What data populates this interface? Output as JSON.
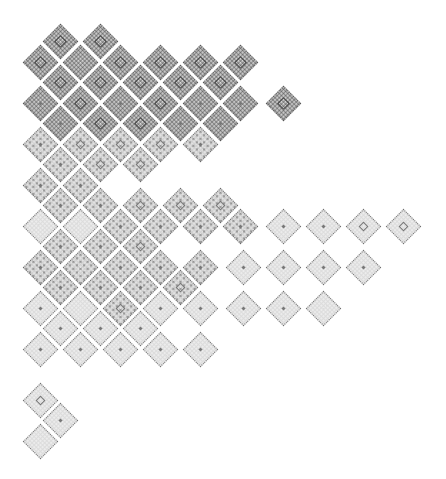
{
  "title": "",
  "colors": {
    "background": "#ffffff",
    "outline": "#6e6e6e",
    "fill": "#ececec",
    "dense_fill": "#d8d8d8"
  },
  "tile_size": 25,
  "rows": [
    {
      "y": 41,
      "tiles": [
        {
          "x": 60,
          "d": "dense",
          "c": "box"
        },
        {
          "x": 100,
          "d": "dense",
          "c": "box"
        }
      ]
    },
    {
      "y": 62,
      "tiles": [
        {
          "x": 40,
          "d": "dense",
          "c": "box"
        },
        {
          "x": 80,
          "d": "dense",
          "c": "none"
        },
        {
          "x": 120,
          "d": "dense",
          "c": "box"
        },
        {
          "x": 160,
          "d": "dense",
          "c": "box"
        },
        {
          "x": 200,
          "d": "dense",
          "c": "box"
        },
        {
          "x": 240,
          "d": "dense",
          "c": "box"
        }
      ]
    },
    {
      "y": 82,
      "tiles": [
        {
          "x": 60,
          "d": "dense",
          "c": "box"
        },
        {
          "x": 100,
          "d": "dense",
          "c": "box"
        },
        {
          "x": 140,
          "d": "dense",
          "c": "box"
        },
        {
          "x": 180,
          "d": "dense",
          "c": "box"
        },
        {
          "x": 220,
          "d": "dense",
          "c": "box"
        }
      ]
    },
    {
      "y": 103,
      "tiles": [
        {
          "x": 40,
          "d": "dense",
          "c": "dot"
        },
        {
          "x": 80,
          "d": "dense",
          "c": "box"
        },
        {
          "x": 120,
          "d": "dense",
          "c": "dot"
        },
        {
          "x": 160,
          "d": "dense",
          "c": "box"
        },
        {
          "x": 200,
          "d": "dense",
          "c": "dot"
        },
        {
          "x": 240,
          "d": "dense",
          "c": "dot"
        },
        {
          "x": 283,
          "d": "dense",
          "c": "box"
        }
      ]
    },
    {
      "y": 123,
      "tiles": [
        {
          "x": 60,
          "d": "dense",
          "c": "dot"
        },
        {
          "x": 100,
          "d": "dense",
          "c": "box"
        },
        {
          "x": 140,
          "d": "dense",
          "c": "box"
        },
        {
          "x": 180,
          "d": "dense",
          "c": "dot"
        },
        {
          "x": 220,
          "d": "dense",
          "c": "dot"
        }
      ]
    },
    {
      "y": 144,
      "tiles": [
        {
          "x": 40,
          "d": "medium",
          "c": "dot"
        },
        {
          "x": 80,
          "d": "medium",
          "c": "box"
        },
        {
          "x": 120,
          "d": "medium",
          "c": "box"
        },
        {
          "x": 160,
          "d": "medium",
          "c": "box"
        },
        {
          "x": 200,
          "d": "medium",
          "c": "dot"
        }
      ]
    },
    {
      "y": 164,
      "tiles": [
        {
          "x": 60,
          "d": "medium",
          "c": "dot"
        },
        {
          "x": 100,
          "d": "medium",
          "c": "box"
        },
        {
          "x": 140,
          "d": "medium",
          "c": "box"
        }
      ]
    },
    {
      "y": 185,
      "tiles": [
        {
          "x": 40,
          "d": "medium",
          "c": "dot"
        },
        {
          "x": 80,
          "d": "medium",
          "c": "dot"
        }
      ]
    },
    {
      "y": 205,
      "tiles": [
        {
          "x": 60,
          "d": "medium",
          "c": "dot"
        },
        {
          "x": 100,
          "d": "medium",
          "c": "dot"
        },
        {
          "x": 140,
          "d": "medium",
          "c": "box"
        },
        {
          "x": 180,
          "d": "medium",
          "c": "box"
        },
        {
          "x": 220,
          "d": "medium",
          "c": "box"
        }
      ]
    },
    {
      "y": 226,
      "tiles": [
        {
          "x": 40,
          "d": "light",
          "c": "none"
        },
        {
          "x": 80,
          "d": "light",
          "c": "none"
        },
        {
          "x": 120,
          "d": "medium",
          "c": "dot"
        },
        {
          "x": 160,
          "d": "medium",
          "c": "dot"
        },
        {
          "x": 200,
          "d": "medium",
          "c": "dot"
        },
        {
          "x": 240,
          "d": "medium",
          "c": "dot"
        },
        {
          "x": 283,
          "d": "light",
          "c": "dot"
        },
        {
          "x": 323,
          "d": "light",
          "c": "dot"
        },
        {
          "x": 363,
          "d": "light",
          "c": "box"
        },
        {
          "x": 403,
          "d": "light",
          "c": "box"
        }
      ]
    },
    {
      "y": 246,
      "tiles": [
        {
          "x": 60,
          "d": "medium",
          "c": "dot"
        },
        {
          "x": 100,
          "d": "medium",
          "c": "dot"
        },
        {
          "x": 140,
          "d": "medium",
          "c": "box"
        }
      ]
    },
    {
      "y": 267,
      "tiles": [
        {
          "x": 40,
          "d": "medium",
          "c": "dot"
        },
        {
          "x": 80,
          "d": "medium",
          "c": "none"
        },
        {
          "x": 120,
          "d": "medium",
          "c": "dot"
        },
        {
          "x": 160,
          "d": "medium",
          "c": "dot"
        },
        {
          "x": 200,
          "d": "medium",
          "c": "dot"
        },
        {
          "x": 243,
          "d": "light",
          "c": "dot"
        },
        {
          "x": 283,
          "d": "light",
          "c": "dot"
        },
        {
          "x": 323,
          "d": "light",
          "c": "dot"
        },
        {
          "x": 363,
          "d": "light",
          "c": "dot"
        }
      ]
    },
    {
      "y": 287,
      "tiles": [
        {
          "x": 60,
          "d": "medium",
          "c": "dot"
        },
        {
          "x": 100,
          "d": "medium",
          "c": "dot"
        },
        {
          "x": 140,
          "d": "medium",
          "c": "dot"
        },
        {
          "x": 180,
          "d": "medium",
          "c": "box"
        }
      ]
    },
    {
      "y": 308,
      "tiles": [
        {
          "x": 40,
          "d": "light",
          "c": "dot"
        },
        {
          "x": 80,
          "d": "light",
          "c": "none"
        },
        {
          "x": 120,
          "d": "medium",
          "c": "box"
        },
        {
          "x": 160,
          "d": "light",
          "c": "dot"
        },
        {
          "x": 200,
          "d": "light",
          "c": "dot"
        },
        {
          "x": 243,
          "d": "light",
          "c": "dot"
        },
        {
          "x": 283,
          "d": "light",
          "c": "dot"
        },
        {
          "x": 323,
          "d": "light",
          "c": "none"
        }
      ]
    },
    {
      "y": 328,
      "tiles": [
        {
          "x": 60,
          "d": "light",
          "c": "dot"
        },
        {
          "x": 100,
          "d": "light",
          "c": "dot"
        },
        {
          "x": 140,
          "d": "light",
          "c": "dot"
        }
      ]
    },
    {
      "y": 349,
      "tiles": [
        {
          "x": 40,
          "d": "light",
          "c": "dot"
        },
        {
          "x": 80,
          "d": "light",
          "c": "dot"
        },
        {
          "x": 120,
          "d": "light",
          "c": "dot"
        },
        {
          "x": 160,
          "d": "light",
          "c": "dot"
        },
        {
          "x": 200,
          "d": "light",
          "c": "dot"
        }
      ]
    },
    {
      "y": 400,
      "tiles": [
        {
          "x": 40,
          "d": "light",
          "c": "box"
        }
      ]
    },
    {
      "y": 420,
      "tiles": [
        {
          "x": 60,
          "d": "light",
          "c": "dot"
        }
      ]
    },
    {
      "y": 441,
      "tiles": [
        {
          "x": 40,
          "d": "light",
          "c": "none"
        }
      ]
    }
  ]
}
